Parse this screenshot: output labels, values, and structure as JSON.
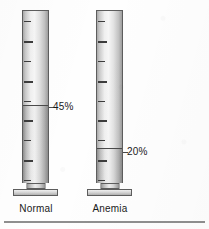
{
  "figure": {
    "background_color": "#fefefe",
    "bottom_rule": {
      "x": 4,
      "y": 221,
      "width": 201,
      "height": 2,
      "color": "#8f8f8f"
    }
  },
  "chart_data": {
    "type": "bar",
    "title": "",
    "subtitle": "",
    "xlabel": "",
    "ylabel": "",
    "ylim": [
      0,
      100
    ],
    "grid": true,
    "legend_position": "none",
    "units": "percent",
    "categories": [
      "Normal",
      "Anemia"
    ],
    "values": [
      45,
      20
    ],
    "data_labels": [
      "45%",
      "20%"
    ],
    "tick_count": 9
  },
  "cylinders": [
    {
      "id": "normal",
      "caption": "Normal",
      "value_label": "45%",
      "value": 45,
      "geometry": {
        "left": 22,
        "top": 10,
        "width": 27,
        "body_height": 173,
        "fill_percent": 45
      },
      "callout": {
        "text": "45%",
        "x": 53,
        "y": 101,
        "leader_x": 49,
        "leader_y": 107,
        "leader_width": 5
      },
      "caption_box": {
        "x": 8,
        "y": 203,
        "width": 56
      },
      "foot": {
        "neck_width": 19,
        "neck_height": 6,
        "plate_left": 13,
        "plate_width": 45,
        "plate_height": 7
      }
    },
    {
      "id": "anemia",
      "caption": "Anemia",
      "value_label": "20%",
      "value": 20,
      "geometry": {
        "left": 96,
        "top": 10,
        "width": 27,
        "body_height": 173,
        "fill_percent": 20
      },
      "callout": {
        "text": "20%",
        "x": 127,
        "y": 146,
        "leader_x": 123,
        "leader_y": 152,
        "leader_width": 5
      },
      "caption_box": {
        "x": 82,
        "y": 203,
        "width": 56
      },
      "foot": {
        "neck_width": 19,
        "neck_height": 6,
        "plate_left": 13,
        "plate_width": 45,
        "plate_height": 7
      }
    }
  ],
  "icons": {
    "cylinder": "graduated-cylinder-icon",
    "tick": "graduation-tick-icon"
  },
  "colors": {
    "outline": "#5d5d5d",
    "tick": "#3c3c3c",
    "reading_line": "#4a4a4a",
    "text": "#1a1a1a",
    "rule": "#8f8f8f"
  }
}
